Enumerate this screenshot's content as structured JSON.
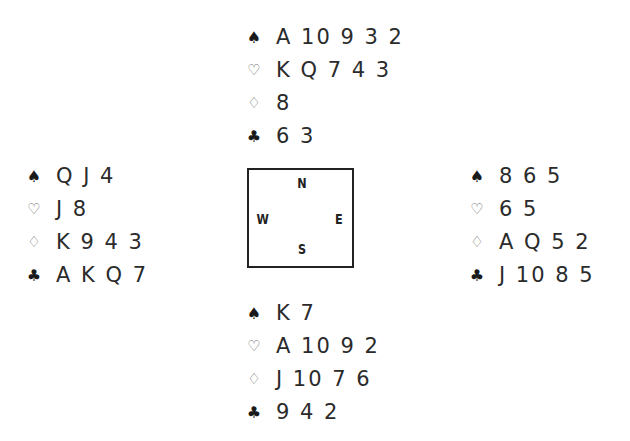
{
  "diagram": {
    "type": "bridge-deal",
    "compass": {
      "north": "N",
      "south": "S",
      "east": "E",
      "west": "W"
    },
    "suit_symbols": {
      "spades": "♠",
      "hearts": "♡",
      "diamonds": "♢",
      "clubs": "♣"
    },
    "hands": {
      "north": {
        "spades": "A 10 9 3 2",
        "hearts": "K Q 7 4 3",
        "diamonds": "8",
        "clubs": "6 3"
      },
      "west": {
        "spades": "Q J 4",
        "hearts": "J 8",
        "diamonds": "K 9 4 3",
        "clubs": "A K Q 7"
      },
      "east": {
        "spades": "8 6 5",
        "hearts": "6 5",
        "diamonds": "A Q 5 2",
        "clubs": "J 10 8 5"
      },
      "south": {
        "spades": "K 7",
        "hearts": "A 10 9 2",
        "diamonds": "J 10 7 6",
        "clubs": "9 4 2"
      }
    }
  },
  "colors": {
    "text": "#2b2b2b",
    "box_border": "#222222",
    "outline_suit": "#6a6a6a"
  }
}
